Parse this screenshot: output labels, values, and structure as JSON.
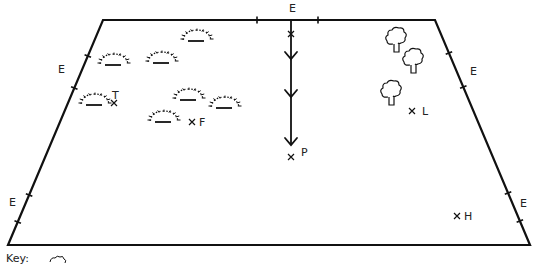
{
  "diagram": {
    "type": "field-map",
    "boundary": {
      "shape": "trapezoid",
      "corners": [
        [
          103,
          20
        ],
        [
          435,
          20
        ],
        [
          530,
          245
        ],
        [
          8,
          245
        ]
      ]
    },
    "entrances": [
      {
        "label": "E",
        "side": "top",
        "x": 289,
        "y": 12
      },
      {
        "label": "E",
        "side": "left-upper",
        "x": 58,
        "y": 73
      },
      {
        "label": "E",
        "side": "left-lower",
        "x": 9,
        "y": 206
      },
      {
        "label": "E",
        "side": "right-upper",
        "x": 470,
        "y": 75
      },
      {
        "label": "E",
        "side": "right-lower",
        "x": 520,
        "y": 207
      }
    ],
    "points": [
      {
        "label": "T",
        "x": 114,
        "y": 103,
        "label_x": 112,
        "label_y": 99,
        "label_pos": "above"
      },
      {
        "label": "F",
        "x": 192,
        "y": 122,
        "label_x": 199,
        "label_y": 126
      },
      {
        "label": "P",
        "x": 291,
        "y": 157,
        "label_x": 301,
        "label_y": 156
      },
      {
        "label": "L",
        "x": 412,
        "y": 111,
        "label_x": 422,
        "label_y": 115
      },
      {
        "label": "H",
        "x": 457,
        "y": 216,
        "label_x": 464,
        "label_y": 220
      }
    ],
    "path": {
      "start_marker": "x",
      "from": [
        291,
        20
      ],
      "to": [
        291,
        145
      ],
      "arrowheads_y": [
        59,
        97,
        145
      ],
      "direction": "down"
    },
    "bushes": [
      {
        "x": 197,
        "y": 38
      },
      {
        "x": 114,
        "y": 62
      },
      {
        "x": 162,
        "y": 60
      },
      {
        "x": 95,
        "y": 102
      },
      {
        "x": 189,
        "y": 97
      },
      {
        "x": 225,
        "y": 105
      },
      {
        "x": 164,
        "y": 119
      }
    ],
    "trees": [
      {
        "x": 396,
        "y": 38
      },
      {
        "x": 413,
        "y": 59
      },
      {
        "x": 391,
        "y": 91
      }
    ],
    "key": {
      "label": "Key:"
    },
    "colors": {
      "line": "#111111",
      "background": "#ffffff"
    }
  }
}
